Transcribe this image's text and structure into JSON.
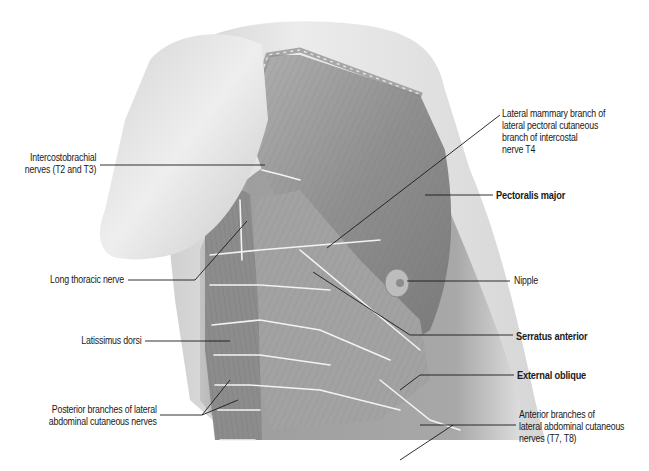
{
  "figure": {
    "colors": {
      "background": "#ffffff",
      "skin_light": "#e6e6e6",
      "skin_shadow": "#b8b8b8",
      "muscle": "#9a9a9a",
      "muscle_dark": "#6e6e6e",
      "nerve": "#f2f2f2",
      "leader_line": "#1a1a1a"
    }
  },
  "labels": {
    "left": [
      {
        "id": "intercostobrachial",
        "lines": [
          "Intercostobrachial",
          "nerves (T2 and T3)"
        ],
        "bold": false
      },
      {
        "id": "long-thoracic",
        "lines": [
          "Long thoracic nerve"
        ],
        "bold": false
      },
      {
        "id": "latissimus",
        "lines": [
          "Latissimus dorsi"
        ],
        "bold": false
      },
      {
        "id": "posterior-branches",
        "lines": [
          "Posterior branches of lateral",
          "abdominal cutaneous nerves"
        ],
        "bold": false
      }
    ],
    "right": [
      {
        "id": "lateral-mammary",
        "lines": [
          "Lateral mammary branch of",
          "lateral pectoral cutaneous",
          "branch of intercostal",
          "nerve T4"
        ],
        "bold": false
      },
      {
        "id": "pectoralis-major",
        "lines": [
          "Pectoralis major"
        ],
        "bold": true
      },
      {
        "id": "nipple",
        "lines": [
          "Nipple"
        ],
        "bold": false
      },
      {
        "id": "serratus-anterior",
        "lines": [
          "Serratus anterior"
        ],
        "bold": true
      },
      {
        "id": "external-oblique",
        "lines": [
          "External oblique"
        ],
        "bold": true
      },
      {
        "id": "anterior-branches",
        "lines": [
          "Anterior branches of",
          "lateral abdominal cutaneous",
          "nerves (T7, T8)"
        ],
        "bold": false
      }
    ]
  }
}
